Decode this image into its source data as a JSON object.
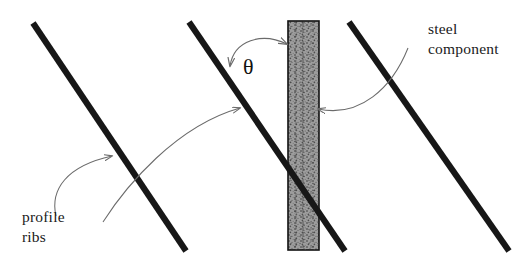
{
  "figure": {
    "type": "technical-diagram",
    "background_color": "#ffffff",
    "width": 527,
    "height": 268
  },
  "labels": {
    "profile_ribs": {
      "line1": "profile",
      "line2": "ribs",
      "x": 22,
      "y": 222
    },
    "steel_component": {
      "line1": "steel",
      "line2": "component",
      "x": 428,
      "y": 34
    },
    "angle_symbol": {
      "text": "θ",
      "x": 243,
      "y": 74
    }
  },
  "ribs": {
    "color": "#171717",
    "stroke_width": 6.2,
    "items": [
      {
        "name": "profile-rib-left",
        "x1": 33,
        "y1": 23,
        "x2": 186,
        "y2": 251
      },
      {
        "name": "profile-rib-middle",
        "x1": 189,
        "y1": 22,
        "x2": 345,
        "y2": 251
      },
      {
        "name": "profile-rib-right",
        "x1": 349,
        "y1": 22,
        "x2": 509,
        "y2": 251
      }
    ]
  },
  "steel_component": {
    "name": "steel-component-bar",
    "x": 288,
    "y": 21,
    "width": 31,
    "height": 229,
    "fill_color": "#9a9a9a",
    "border_color": "#111111",
    "border_width": 1.6,
    "texture": "stippled-gray"
  },
  "annotations": {
    "leader_color": "#6b6b6b",
    "arrows": [
      {
        "name": "leader-profile-ribs-short",
        "path": "M 56,216 C 50,190 66,166 112,156",
        "head_at": [
          112,
          156
        ],
        "head_angle": -20
      },
      {
        "name": "leader-profile-ribs-long",
        "path": "M 103,222 C 126,186 176,126 240,108",
        "head_at": [
          240,
          108
        ],
        "head_angle": -18
      },
      {
        "name": "leader-steel-component",
        "path": "M 408,48 C 392,88 360,118 318,109",
        "head_at": [
          318,
          109
        ],
        "head_angle": 190
      }
    ],
    "angle_arc": {
      "name": "angle-arc-theta",
      "path": "M 230,66 C 234,40 262,32 287,44",
      "head_start": [
        230,
        66
      ],
      "head_end": [
        287,
        44
      ],
      "double_headed": true
    }
  }
}
